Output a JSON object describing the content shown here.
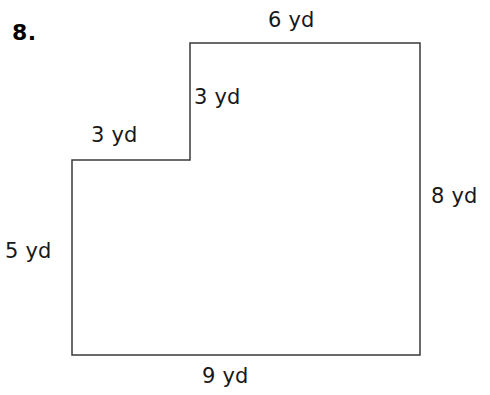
{
  "problem": {
    "number": "8."
  },
  "figure": {
    "shape_name": "l-shaped-polygon",
    "stroke_color": "#3a3a3a",
    "fill_color": "#ffffff",
    "stroke_width": 1.5,
    "unit": "yd",
    "vertices": [
      {
        "x": 190,
        "y": 43
      },
      {
        "x": 420,
        "y": 43
      },
      {
        "x": 420,
        "y": 355
      },
      {
        "x": 72,
        "y": 355
      },
      {
        "x": 72,
        "y": 160
      },
      {
        "x": 190,
        "y": 160
      }
    ]
  },
  "labels": {
    "top": "6 yd",
    "step_vertical": "3 yd",
    "step_horizontal": "3 yd",
    "right": "8 yd",
    "left": "5 yd",
    "bottom": "9 yd"
  },
  "measurements": [
    {
      "side": "top",
      "value": 6,
      "unit": "yd",
      "text": "6 yd"
    },
    {
      "side": "step_vertical",
      "value": 3,
      "unit": "yd",
      "text": "3 yd"
    },
    {
      "side": "step_horizontal",
      "value": 3,
      "unit": "yd",
      "text": "3 yd"
    },
    {
      "side": "right",
      "value": 8,
      "unit": "yd",
      "text": "8 yd"
    },
    {
      "side": "left",
      "value": 5,
      "unit": "yd",
      "text": "5 yd"
    },
    {
      "side": "bottom",
      "value": 9,
      "unit": "yd",
      "text": "9 yd"
    }
  ]
}
